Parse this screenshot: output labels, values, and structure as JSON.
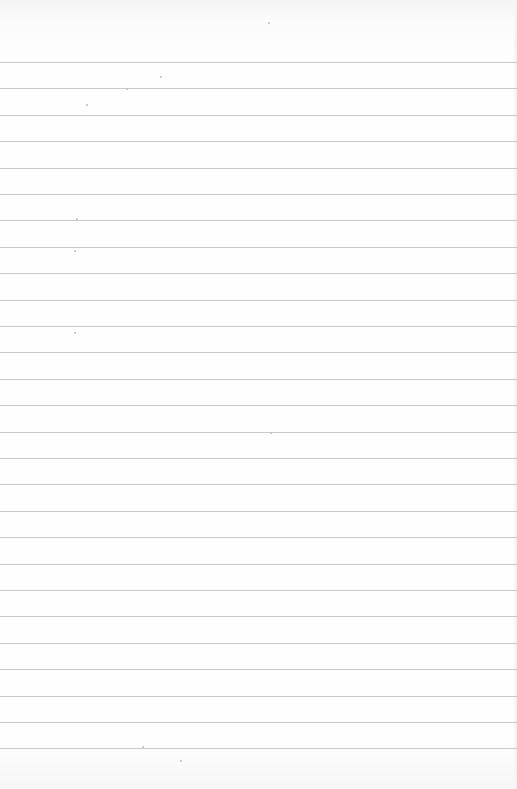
{
  "page": {
    "type": "lined-paper",
    "background_color": "#fefefe",
    "rule_color": "#c9c9c9",
    "rule_count": 27,
    "first_rule_y": 62,
    "rule_spacing": 26.4,
    "text": ""
  }
}
